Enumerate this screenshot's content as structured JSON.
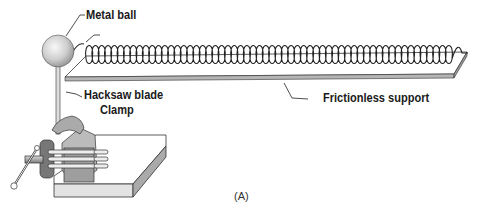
{
  "figure": {
    "labels": {
      "metal_ball": "Metal ball",
      "hacksaw_blade": "Hacksaw blade",
      "clamp": "Clamp",
      "frictionless_support": "Frictionless support"
    },
    "caption": "(A)"
  },
  "colors": {
    "line": "#222222",
    "ball_light": "#f2f2f2",
    "ball_dark": "#8a8a8a",
    "metal_gray": "#9a9a9a",
    "board_top": "#ffffff",
    "board_edge": "#b5b5b5"
  },
  "spring": {
    "coil_count": 58
  }
}
